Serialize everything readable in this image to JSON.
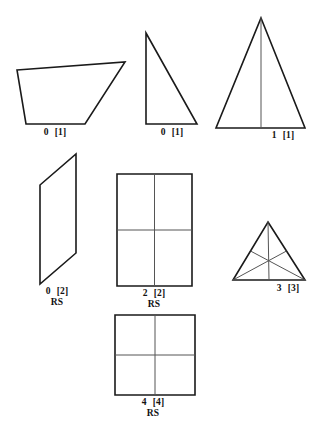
{
  "figure": {
    "stroke_color": "#1a1a1a",
    "inner_stroke_color": "#555555",
    "background_color": "#ffffff",
    "shapes": [
      {
        "id": "quadrilateral",
        "name": "irregular-quadrilateral",
        "points": "17,70 125,62 85,124 26,124",
        "inner_lines": [],
        "label": {
          "num": "0",
          "brk": "[1]",
          "rs": "",
          "x": 55,
          "y": 127
        }
      },
      {
        "id": "right-triangle",
        "name": "right-triangle",
        "points": "146,33 197,124 146,124",
        "inner_lines": [],
        "label": {
          "num": "0",
          "brk": "[1]",
          "rs": "",
          "x": 172,
          "y": 127
        }
      },
      {
        "id": "isoceles-triangle",
        "name": "isoceles-triangle-with-axis",
        "points": "261,18 305,128 216,128",
        "inner_lines": [
          "261,18 261,128"
        ],
        "label": {
          "num": "1",
          "brk": "[1]",
          "rs": "",
          "x": 283,
          "y": 130
        }
      },
      {
        "id": "parallelogram",
        "name": "parallelogram",
        "points": "76,154 76,253 40,284 40,185",
        "inner_lines": [],
        "label": {
          "num": "0",
          "brk": "[2]",
          "rs": "RS",
          "x": 57,
          "y": 286
        }
      },
      {
        "id": "rectangle-grid",
        "name": "rectangle-with-2x2-grid",
        "points": "117,174 192,174 192,286 117,286",
        "inner_lines": [
          "154.5,174 154.5,286",
          "117,230 192,230"
        ],
        "label": {
          "num": "2",
          "brk": "[2]",
          "rs": "RS",
          "x": 154,
          "y": 288
        }
      },
      {
        "id": "median-triangle",
        "name": "triangle-with-medians",
        "points": "268,222 305,280 233,280",
        "inner_lines": [
          "268,222 269,280",
          "233,280 286.5,251",
          "305,280 250.5,251"
        ],
        "label": {
          "num": "3",
          "brk": "[3]",
          "rs": "",
          "x": 288,
          "y": 283
        }
      },
      {
        "id": "square-grid",
        "name": "square-with-2x2-grid",
        "points": "115,315 195,315 195,395 115,395",
        "inner_lines": [
          "155,315 155,395",
          "115,355 195,355"
        ],
        "label": {
          "num": "4",
          "brk": "[4]",
          "rs": "RS",
          "x": 153,
          "y": 397
        }
      }
    ]
  }
}
